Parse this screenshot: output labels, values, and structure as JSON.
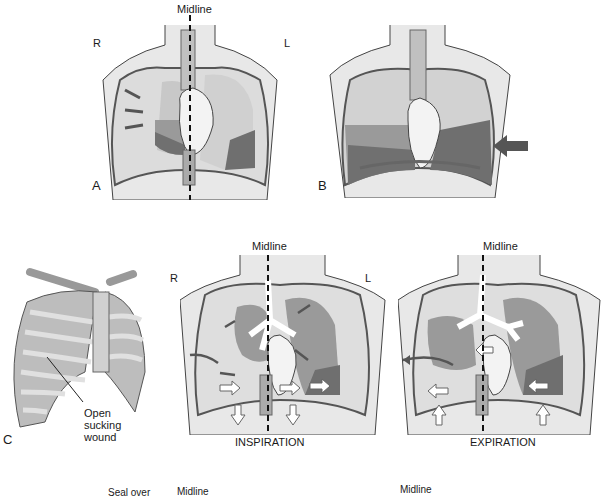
{
  "figure": {
    "panels": [
      {
        "id": "A",
        "letter": "A",
        "midline_label": "Midline",
        "side_right": "R",
        "side_left": "L"
      },
      {
        "id": "B",
        "letter": "B"
      },
      {
        "id": "C",
        "letter": "C",
        "wound_label_1": "Open",
        "wound_label_2": "sucking",
        "wound_label_3": "wound"
      },
      {
        "id": "C-inspiration",
        "midline_label": "Midline",
        "side_right": "R",
        "side_left": "L",
        "caption": "INSPIRATION"
      },
      {
        "id": "C-expiration",
        "midline_label": "Midline",
        "caption": "EXPIRATION"
      }
    ],
    "bottom_partial": {
      "seal_label": "Seal over",
      "midline_1": "Midline",
      "midline_2": "Midline"
    }
  },
  "colors": {
    "skin": "#e4e4e4",
    "lung_light": "#c9c9c9",
    "lung_mid": "#9a9a9a",
    "lung_dark": "#6f6f6f",
    "arrow": "#555555",
    "line": "#333333"
  }
}
